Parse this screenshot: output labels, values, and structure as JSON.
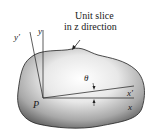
{
  "diagram": {
    "caption_line1": "Unit slice",
    "caption_line2": "in z direction",
    "point_label": "P",
    "axis_x": "x",
    "axis_y": "y",
    "axis_x_prime": "x′",
    "axis_y_prime": "y′",
    "angle_label": "θ"
  }
}
